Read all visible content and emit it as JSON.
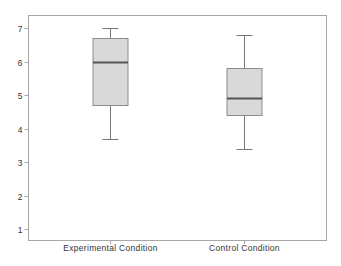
{
  "chart_data": {
    "type": "box",
    "title": "",
    "xlabel": "",
    "ylabel": "",
    "ylim": [
      0.7,
      7.4
    ],
    "yticks": [
      1,
      2,
      3,
      4,
      5,
      6,
      7
    ],
    "grid": false,
    "legend": null,
    "categories": [
      "Experimental Condition",
      "Control Condition"
    ],
    "series": [
      {
        "name": "Experimental Condition",
        "whisker_low": 3.7,
        "q1": 4.7,
        "median": 6.0,
        "q3": 6.7,
        "whisker_high": 7.0
      },
      {
        "name": "Control Condition",
        "whisker_low": 3.4,
        "q1": 4.4,
        "median": 4.9,
        "q3": 5.8,
        "whisker_high": 6.8
      }
    ],
    "colors": {
      "box_fill": "#d9d9d9",
      "box_stroke": "#8c8c8c",
      "median": "#555555",
      "whisker": "#777777",
      "frame": "#a6a6a6"
    }
  }
}
